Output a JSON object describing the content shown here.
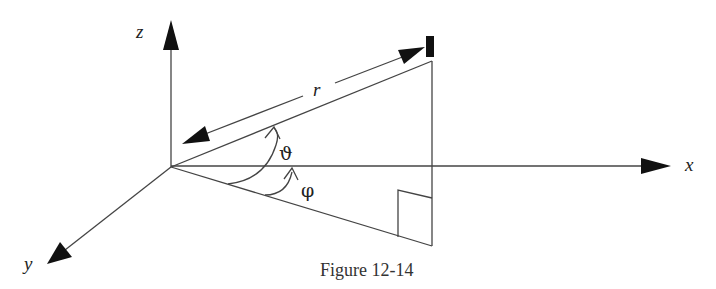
{
  "diagram": {
    "type": "spherical-coordinates",
    "caption": "Figure 12-14",
    "axes": {
      "x": {
        "label": "x"
      },
      "y": {
        "label": "y"
      },
      "z": {
        "label": "z"
      }
    },
    "labels": {
      "radius": "r",
      "polar_angle": "ϑ",
      "azimuth_angle": "φ"
    },
    "colors": {
      "line": "#444444",
      "arrow": "#111111",
      "text": "#222222"
    }
  }
}
